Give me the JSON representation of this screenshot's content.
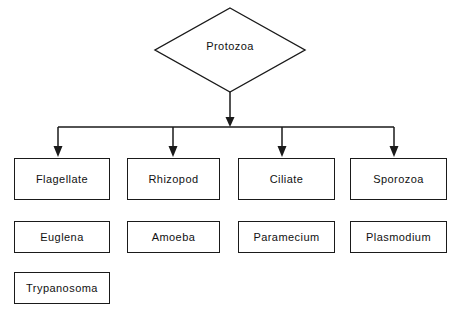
{
  "diagram": {
    "root": {
      "label": "Protozoa",
      "shape": "diamond"
    },
    "colors": {
      "stroke": "#1a1a1a",
      "fill": "#ffffff",
      "text": "#111111",
      "background": "#ffffff"
    },
    "levels": [
      {
        "name": "classes",
        "nodes": [
          {
            "label": "Flagellate"
          },
          {
            "label": "Rhizopod"
          },
          {
            "label": "Ciliate"
          },
          {
            "label": "Sporozoa"
          }
        ]
      },
      {
        "name": "examples",
        "nodes": [
          {
            "label": "Euglena"
          },
          {
            "label": "Amoeba"
          },
          {
            "label": "Paramecium"
          },
          {
            "label": "Plasmodium"
          }
        ]
      },
      {
        "name": "additional-examples",
        "nodes": [
          {
            "label": "Trypanosoma"
          }
        ]
      }
    ],
    "connectors": {
      "root_to_bus": "vertical-arrow",
      "bus": "horizontal-distribution-bar",
      "bus_to_classes": "four-down-arrows"
    }
  }
}
